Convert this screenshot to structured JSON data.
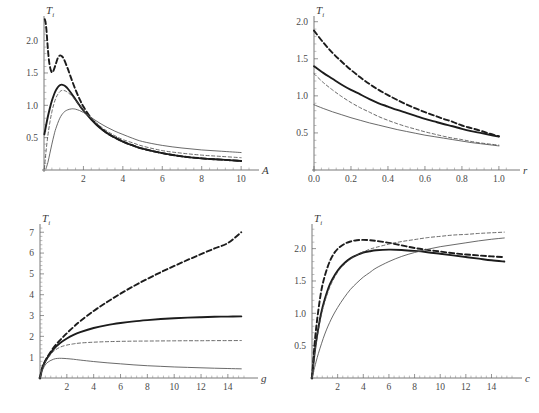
{
  "figure": {
    "background": "#ffffff",
    "panel_count": 4
  },
  "chart_data": [
    {
      "id": "panel-A",
      "type": "line",
      "position": "top-left",
      "title": "",
      "xlabel": "A",
      "ylabel": "T_i",
      "ylabel_base": "T",
      "ylabel_sub": "i",
      "xlim": [
        0,
        10.4
      ],
      "ylim": [
        0,
        2.35
      ],
      "xticks": [
        2,
        4,
        6,
        8,
        10
      ],
      "xtick_labels": [
        "2",
        "4",
        "6",
        "8",
        "10"
      ],
      "yticks": [
        0.5,
        1.0,
        1.5,
        2.0
      ],
      "ytick_labels": [
        "0.5",
        "1.0",
        "1.5",
        "2.0"
      ],
      "grid": false,
      "legend": "none",
      "series": [
        {
          "name": "thick-dashed",
          "style": "thick-dashed",
          "x": [
            0.04,
            0.08,
            0.12,
            0.16,
            0.2,
            0.25,
            0.3,
            0.35,
            0.4,
            0.45,
            0.5,
            0.6,
            0.7,
            0.8,
            0.9,
            1.0,
            1.2,
            1.4,
            1.6,
            1.8,
            2.0,
            2.4,
            2.8,
            3.2,
            3.6,
            4.0,
            4.5,
            5.0,
            6.0,
            7.0,
            8.0,
            9.0,
            10.0
          ],
          "y": [
            2.33,
            2.28,
            2.18,
            2.02,
            1.86,
            1.7,
            1.6,
            1.54,
            1.51,
            1.52,
            1.55,
            1.64,
            1.73,
            1.77,
            1.76,
            1.72,
            1.57,
            1.4,
            1.24,
            1.1,
            0.98,
            0.8,
            0.67,
            0.57,
            0.5,
            0.44,
            0.38,
            0.33,
            0.26,
            0.21,
            0.18,
            0.16,
            0.14
          ]
        },
        {
          "name": "thick-solid",
          "style": "thick-solid",
          "x": [
            0.02,
            0.1,
            0.2,
            0.3,
            0.4,
            0.5,
            0.6,
            0.7,
            0.8,
            0.9,
            1.0,
            1.1,
            1.2,
            1.4,
            1.6,
            1.8,
            2.0,
            2.4,
            2.8,
            3.2,
            3.6,
            4.0,
            4.5,
            5.0,
            6.0,
            7.0,
            8.0,
            9.0,
            10.0
          ],
          "y": [
            0.55,
            0.68,
            0.83,
            0.96,
            1.07,
            1.16,
            1.23,
            1.28,
            1.31,
            1.32,
            1.31,
            1.29,
            1.26,
            1.18,
            1.09,
            1.0,
            0.92,
            0.78,
            0.66,
            0.57,
            0.5,
            0.44,
            0.38,
            0.33,
            0.26,
            0.21,
            0.18,
            0.16,
            0.14
          ]
        },
        {
          "name": "thin-dashed",
          "style": "thin-dashed",
          "x": [
            0.02,
            0.1,
            0.2,
            0.3,
            0.4,
            0.5,
            0.6,
            0.7,
            0.8,
            0.9,
            1.0,
            1.1,
            1.2,
            1.4,
            1.6,
            1.8,
            2.0,
            2.4,
            2.8,
            3.2,
            3.6,
            4.0,
            4.5,
            5.0,
            6.0,
            7.0,
            8.0,
            9.0,
            10.0
          ],
          "y": [
            0.02,
            0.28,
            0.54,
            0.74,
            0.9,
            1.02,
            1.11,
            1.17,
            1.21,
            1.23,
            1.23,
            1.22,
            1.2,
            1.15,
            1.08,
            1.0,
            0.93,
            0.8,
            0.69,
            0.6,
            0.53,
            0.47,
            0.42,
            0.37,
            0.3,
            0.26,
            0.23,
            0.21,
            0.19
          ]
        },
        {
          "name": "thin-solid",
          "style": "thin-solid",
          "x": [
            0.1,
            0.2,
            0.3,
            0.4,
            0.5,
            0.6,
            0.8,
            1.0,
            1.2,
            1.4,
            1.5,
            1.6,
            1.8,
            2.0,
            2.2,
            2.5,
            2.8,
            3.2,
            3.6,
            4.0,
            4.5,
            5.0,
            6.0,
            7.0,
            8.0,
            9.0,
            10.0
          ],
          "y": [
            0.02,
            0.12,
            0.26,
            0.4,
            0.53,
            0.64,
            0.8,
            0.89,
            0.93,
            0.945,
            0.945,
            0.94,
            0.92,
            0.89,
            0.85,
            0.79,
            0.73,
            0.66,
            0.6,
            0.55,
            0.49,
            0.44,
            0.38,
            0.34,
            0.31,
            0.29,
            0.27
          ]
        }
      ]
    },
    {
      "id": "panel-r",
      "type": "line",
      "position": "top-right",
      "title": "",
      "xlabel": "r",
      "ylabel": "T_i",
      "ylabel_base": "T",
      "ylabel_sub": "i",
      "xlim": [
        0,
        1.06
      ],
      "ylim": [
        0,
        2.05
      ],
      "xticks": [
        0.0,
        0.2,
        0.4,
        0.6,
        0.8,
        1.0
      ],
      "xtick_labels": [
        "0.0",
        "0.2",
        "0.4",
        "0.6",
        "0.8",
        "1.0"
      ],
      "yticks": [
        0.5,
        1.0,
        1.5,
        2.0
      ],
      "ytick_labels": [
        "0.5",
        "1.0",
        "1.5",
        "2.0"
      ],
      "grid": false,
      "legend": "none",
      "series": [
        {
          "name": "thick-dashed",
          "style": "thick-dashed",
          "x": [
            0.0,
            0.05,
            0.1,
            0.15,
            0.2,
            0.25,
            0.3,
            0.35,
            0.4,
            0.45,
            0.5,
            0.55,
            0.6,
            0.65,
            0.7,
            0.75,
            0.8,
            0.85,
            0.9,
            0.95,
            1.0
          ],
          "y": [
            1.88,
            1.72,
            1.58,
            1.46,
            1.35,
            1.25,
            1.16,
            1.08,
            1.01,
            0.945,
            0.885,
            0.83,
            0.78,
            0.735,
            0.69,
            0.65,
            0.6,
            0.565,
            0.53,
            0.49,
            0.455
          ]
        },
        {
          "name": "thick-solid",
          "style": "thick-solid",
          "x": [
            0.0,
            0.05,
            0.1,
            0.15,
            0.2,
            0.25,
            0.3,
            0.35,
            0.4,
            0.45,
            0.5,
            0.55,
            0.6,
            0.65,
            0.7,
            0.75,
            0.8,
            0.85,
            0.9,
            0.95,
            1.0
          ],
          "y": [
            1.4,
            1.31,
            1.23,
            1.15,
            1.08,
            1.02,
            0.955,
            0.9,
            0.855,
            0.81,
            0.77,
            0.73,
            0.69,
            0.655,
            0.62,
            0.59,
            0.555,
            0.525,
            0.5,
            0.475,
            0.45
          ]
        },
        {
          "name": "thin-dashed",
          "style": "thin-dashed",
          "x": [
            0.0,
            0.05,
            0.1,
            0.15,
            0.2,
            0.25,
            0.3,
            0.35,
            0.4,
            0.45,
            0.5,
            0.55,
            0.6,
            0.65,
            0.7,
            0.75,
            0.8,
            0.85,
            0.9,
            0.95,
            1.0
          ],
          "y": [
            1.3,
            1.18,
            1.08,
            0.99,
            0.91,
            0.84,
            0.78,
            0.72,
            0.67,
            0.625,
            0.585,
            0.55,
            0.515,
            0.485,
            0.455,
            0.43,
            0.41,
            0.385,
            0.365,
            0.35,
            0.335
          ]
        },
        {
          "name": "thin-solid",
          "style": "thin-solid",
          "x": [
            0.0,
            0.05,
            0.1,
            0.15,
            0.2,
            0.25,
            0.3,
            0.35,
            0.4,
            0.45,
            0.5,
            0.55,
            0.6,
            0.65,
            0.7,
            0.75,
            0.8,
            0.85,
            0.9,
            0.95,
            1.0
          ],
          "y": [
            0.88,
            0.83,
            0.785,
            0.745,
            0.705,
            0.67,
            0.635,
            0.605,
            0.575,
            0.545,
            0.52,
            0.495,
            0.47,
            0.45,
            0.43,
            0.41,
            0.39,
            0.37,
            0.355,
            0.34,
            0.325
          ]
        }
      ]
    },
    {
      "id": "panel-g",
      "type": "line",
      "position": "bottom-left",
      "title": "",
      "xlabel": "g",
      "ylabel": "T_i",
      "ylabel_base": "T",
      "ylabel_sub": "i",
      "xlim": [
        0,
        15.5
      ],
      "ylim": [
        0,
        7.3
      ],
      "xticks": [
        2,
        4,
        6,
        8,
        10,
        12,
        14
      ],
      "xtick_labels": [
        "2",
        "4",
        "6",
        "8",
        "10",
        "12",
        "14"
      ],
      "yticks": [
        1,
        2,
        3,
        4,
        5,
        6,
        7
      ],
      "ytick_labels": [
        "1",
        "2",
        "3",
        "4",
        "5",
        "6",
        "7"
      ],
      "grid": false,
      "legend": "none",
      "series": [
        {
          "name": "thick-dashed",
          "style": "thick-dashed",
          "x": [
            0.0,
            0.2,
            0.5,
            1.0,
            1.5,
            2.0,
            2.5,
            3.0,
            4.0,
            5.0,
            6.0,
            7.0,
            8.0,
            9.0,
            10.0,
            11.0,
            12.0,
            13.0,
            14.0,
            15.0
          ],
          "y": [
            0.0,
            0.55,
            0.95,
            1.45,
            1.82,
            2.15,
            2.45,
            2.73,
            3.22,
            3.65,
            4.05,
            4.42,
            4.76,
            5.08,
            5.38,
            5.67,
            5.95,
            6.22,
            6.48,
            7.0
          ]
        },
        {
          "name": "thick-solid",
          "style": "thick-solid",
          "x": [
            0.0,
            0.2,
            0.5,
            1.0,
            1.5,
            2.0,
            2.5,
            3.0,
            4.0,
            5.0,
            6.0,
            7.0,
            8.0,
            9.0,
            10.0,
            11.0,
            12.0,
            13.0,
            14.0,
            15.0
          ],
          "y": [
            0.0,
            0.52,
            0.92,
            1.38,
            1.68,
            1.9,
            2.07,
            2.2,
            2.4,
            2.54,
            2.64,
            2.72,
            2.78,
            2.83,
            2.87,
            2.9,
            2.92,
            2.94,
            2.95,
            2.96
          ]
        },
        {
          "name": "thin-dashed",
          "style": "thin-dashed",
          "x": [
            0.0,
            0.2,
            0.5,
            1.0,
            1.5,
            2.0,
            2.5,
            3.0,
            4.0,
            5.0,
            6.0,
            7.0,
            8.0,
            9.0,
            10.0,
            11.0,
            12.0,
            13.0,
            14.0,
            15.0
          ],
          "y": [
            0.0,
            0.5,
            0.88,
            1.27,
            1.48,
            1.58,
            1.64,
            1.68,
            1.72,
            1.745,
            1.76,
            1.77,
            1.775,
            1.78,
            1.785,
            1.79,
            1.79,
            1.795,
            1.795,
            1.8
          ]
        },
        {
          "name": "thin-solid",
          "style": "thin-solid",
          "x": [
            0.0,
            0.2,
            0.5,
            1.0,
            1.3,
            1.6,
            2.0,
            2.5,
            3.0,
            4.0,
            5.0,
            6.0,
            7.0,
            8.0,
            9.0,
            10.0,
            11.0,
            12.0,
            13.0,
            14.0,
            15.0
          ],
          "y": [
            0.0,
            0.4,
            0.72,
            0.9,
            0.94,
            0.945,
            0.93,
            0.9,
            0.86,
            0.79,
            0.73,
            0.68,
            0.63,
            0.59,
            0.56,
            0.53,
            0.51,
            0.49,
            0.47,
            0.455,
            0.44
          ]
        }
      ]
    },
    {
      "id": "panel-c",
      "type": "line",
      "position": "bottom-right",
      "title": "",
      "xlabel": "c",
      "ylabel": "T_i",
      "ylabel_base": "T",
      "ylabel_sub": "i",
      "xlim": [
        0,
        15.6
      ],
      "ylim": [
        0,
        2.35
      ],
      "xticks": [
        2,
        4,
        6,
        8,
        10,
        12,
        14
      ],
      "xtick_labels": [
        "2",
        "4",
        "6",
        "8",
        "10",
        "12",
        "14"
      ],
      "yticks": [
        0.5,
        1.0,
        1.5,
        2.0
      ],
      "ytick_labels": [
        "0.5",
        "1.0",
        "1.5",
        "2.0"
      ],
      "grid": false,
      "legend": "none",
      "series": [
        {
          "name": "thick-dashed",
          "style": "thick-dashed",
          "x": [
            0.0,
            0.2,
            0.4,
            0.7,
            1.0,
            1.4,
            1.8,
            2.2,
            2.6,
            3.0,
            3.5,
            4.0,
            4.5,
            5.0,
            6.0,
            7.0,
            8.0,
            9.0,
            10.0,
            11.0,
            12.0,
            13.0,
            14.0,
            15.0
          ],
          "y": [
            0.0,
            0.52,
            0.9,
            1.32,
            1.58,
            1.81,
            1.95,
            2.03,
            2.08,
            2.11,
            2.13,
            2.135,
            2.13,
            2.12,
            2.09,
            2.05,
            2.01,
            1.98,
            1.955,
            1.93,
            1.91,
            1.895,
            1.88,
            1.87
          ]
        },
        {
          "name": "thick-solid",
          "style": "thick-solid",
          "x": [
            0.0,
            0.2,
            0.4,
            0.7,
            1.0,
            1.4,
            1.8,
            2.2,
            2.6,
            3.0,
            3.5,
            4.0,
            4.5,
            5.0,
            6.0,
            7.0,
            8.0,
            9.0,
            10.0,
            11.0,
            12.0,
            13.0,
            14.0,
            15.0
          ],
          "y": [
            0.0,
            0.38,
            0.66,
            0.99,
            1.22,
            1.45,
            1.6,
            1.71,
            1.79,
            1.85,
            1.9,
            1.94,
            1.96,
            1.975,
            1.985,
            1.98,
            1.965,
            1.945,
            1.92,
            1.895,
            1.87,
            1.845,
            1.82,
            1.8
          ]
        },
        {
          "name": "thin-dashed",
          "style": "thin-dashed",
          "x": [
            0.0,
            0.2,
            0.4,
            0.7,
            1.0,
            1.4,
            1.8,
            2.2,
            2.6,
            3.0,
            3.5,
            4.0,
            4.5,
            5.0,
            6.0,
            7.0,
            8.0,
            9.0,
            10.0,
            11.0,
            12.0,
            13.0,
            14.0,
            15.0
          ],
          "y": [
            0.0,
            0.36,
            0.63,
            0.95,
            1.18,
            1.41,
            1.57,
            1.69,
            1.77,
            1.84,
            1.9,
            1.95,
            1.99,
            2.02,
            2.07,
            2.11,
            2.14,
            2.17,
            2.19,
            2.21,
            2.22,
            2.235,
            2.245,
            2.255
          ]
        },
        {
          "name": "thin-solid",
          "style": "thin-solid",
          "x": [
            0.0,
            0.2,
            0.5,
            1.0,
            1.5,
            2.0,
            2.5,
            3.0,
            3.5,
            4.0,
            4.5,
            5.0,
            6.0,
            7.0,
            8.0,
            9.0,
            10.0,
            11.0,
            12.0,
            13.0,
            14.0,
            15.0
          ],
          "y": [
            0.0,
            0.16,
            0.38,
            0.68,
            0.91,
            1.09,
            1.24,
            1.37,
            1.47,
            1.56,
            1.63,
            1.7,
            1.8,
            1.88,
            1.94,
            1.99,
            2.03,
            2.06,
            2.09,
            2.12,
            2.145,
            2.165
          ]
        }
      ]
    }
  ]
}
